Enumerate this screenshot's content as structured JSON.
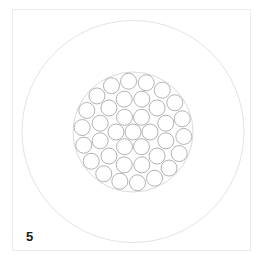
{
  "figure": {
    "label": "5"
  },
  "geometry": {
    "center": [
      133,
      132
    ],
    "outer_circle_radius": 111,
    "bundle_radius": 60,
    "strand_radius": 8,
    "layers": [
      {
        "name": "core",
        "count": 1,
        "ring_radius": 0,
        "phase_deg": 0
      },
      {
        "name": "layer-1",
        "count": 6,
        "ring_radius": 17,
        "phase_deg": 0
      },
      {
        "name": "layer-2",
        "count": 12,
        "ring_radius": 34,
        "phase_deg": 15
      },
      {
        "name": "layer-3",
        "count": 18,
        "ring_radius": 51,
        "phase_deg": 5
      }
    ]
  },
  "colors": {
    "outer_circle": "#e3e3e3",
    "bundle_outline": "#cfcfcf",
    "strand_stroke": "#a9a9a9",
    "strand_fill": "#ffffff",
    "frame": "#ececec",
    "label": "#1c1c1c"
  }
}
